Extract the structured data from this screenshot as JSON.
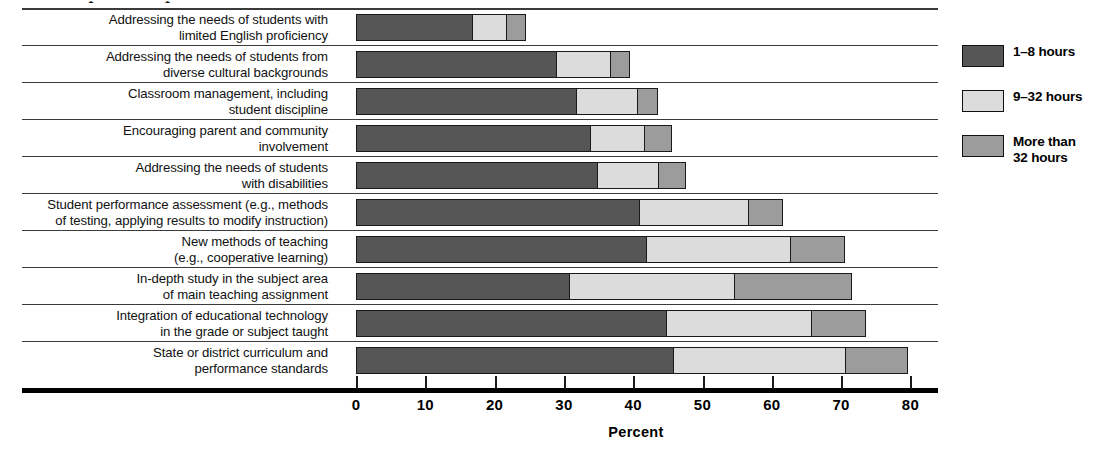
{
  "chart_data": {
    "type": "bar",
    "orientation": "horizontal",
    "stacked": true,
    "title": "",
    "xlabel": "Percent",
    "ylabel": "",
    "xlim": [
      0,
      80
    ],
    "xticks": [
      0,
      10,
      20,
      30,
      40,
      50,
      60,
      70,
      80
    ],
    "grid": false,
    "legend_position": "right",
    "categories": [
      "Addressing the needs of students with limited English proficiency",
      "Addressing the needs of students from diverse cultural backgrounds",
      "Classroom management, including student discipline",
      "Encouraging parent and community involvement",
      "Addressing the needs of students with disabilities",
      "Student performance assessment (e.g., methods of testing, applying results to modify instruction)",
      "New methods of teaching (e.g., cooperative learning)",
      "In-depth study in the subject area of main teaching assignment",
      "Integration of educational technology in the grade or subject taught",
      "State or district curriculum and performance standards"
    ],
    "series": [
      {
        "name": "1–8 hours",
        "color": "#565656",
        "values": [
          17,
          29,
          32,
          34,
          35,
          41,
          42,
          31,
          45,
          46
        ]
      },
      {
        "name": "9–32 hours",
        "color": "#dcdcdc",
        "values": [
          5,
          8,
          9,
          8,
          9,
          16,
          21,
          24,
          21,
          25
        ]
      },
      {
        "name": "More than\n32 hours",
        "color": "#9c9c9c",
        "values": [
          3,
          3,
          3,
          4,
          4,
          5,
          8,
          17,
          8,
          9
        ]
      }
    ],
    "totals": [
      25,
      40,
      44,
      46,
      48,
      62,
      71,
      72,
      74,
      80
    ]
  },
  "axis": {
    "title": "Percent",
    "ticks": [
      "0",
      "10",
      "20",
      "30",
      "40",
      "50",
      "60",
      "70",
      "80"
    ]
  },
  "legend": {
    "items": [
      {
        "label": "1–8 hours",
        "color": "#565656"
      },
      {
        "label": "9–32 hours",
        "color": "#dcdcdc"
      },
      {
        "label": "More than\n32 hours",
        "color": "#9c9c9c"
      }
    ]
  },
  "rows": [
    {
      "line1": "Addressing the needs of students with",
      "line2": "limited English proficiency"
    },
    {
      "line1": "Addressing the needs of students from",
      "line2": "diverse cultural backgrounds"
    },
    {
      "line1": "Classroom management, including",
      "line2": "student discipline"
    },
    {
      "line1": "Encouraging parent and community",
      "line2": "involvement"
    },
    {
      "line1": "Addressing the needs of students",
      "line2": "with disabilities"
    },
    {
      "line1": "Student performance assessment (e.g., methods",
      "line2": "of testing, applying results to modify instruction)"
    },
    {
      "line1": "New methods of teaching",
      "line2": "(e.g., cooperative learning)"
    },
    {
      "line1": "In-depth study in the subject area",
      "line2": "of main teaching assignment"
    },
    {
      "line1": "Integration of educational technology",
      "line2": "in the grade or subject taught"
    },
    {
      "line1": "State or district curriculum and",
      "line2": "performance standards"
    }
  ],
  "title_remnant": "•    •"
}
